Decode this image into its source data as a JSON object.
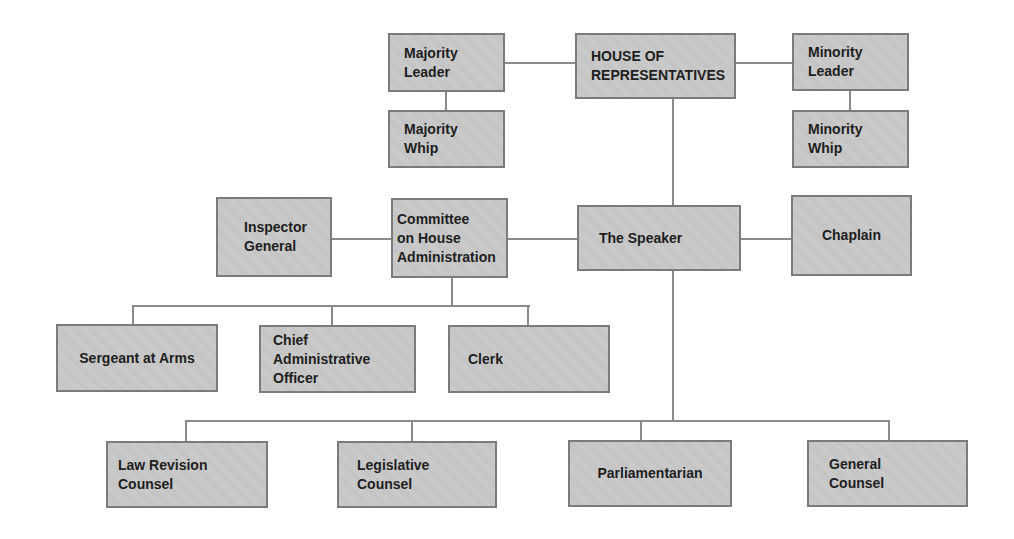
{
  "diagram": {
    "type": "org-chart",
    "colors": {
      "box_fill": "#c9c9c9",
      "box_border": "#7b7b7b",
      "connector": "#8a8a8a",
      "text": "#1e1e1e"
    },
    "nodes": {
      "house": "HOUSE OF\nREPRESENTATIVES",
      "majority_leader": "Majority\nLeader",
      "majority_whip": "Majority\nWhip",
      "minority_leader": "Minority\nLeader",
      "minority_whip": "Minority\nWhip",
      "inspector_general": "Inspector\nGeneral",
      "committee": "Committee\non House\nAdministration",
      "speaker": "The Speaker",
      "chaplain": "Chaplain",
      "sergeant": "Sergeant at Arms",
      "cao": "Chief\nAdministrative\nOfficer",
      "clerk": "Clerk",
      "law_revision": "Law Revision\nCounsel",
      "legislative": "Legislative\nCounsel",
      "parliamentarian": "Parliamentarian",
      "general_counsel": "General\nCounsel"
    },
    "edges": [
      [
        "house",
        "majority_leader"
      ],
      [
        "house",
        "minority_leader"
      ],
      [
        "majority_leader",
        "majority_whip"
      ],
      [
        "minority_leader",
        "minority_whip"
      ],
      [
        "house",
        "speaker"
      ],
      [
        "speaker",
        "committee"
      ],
      [
        "speaker",
        "chaplain"
      ],
      [
        "committee",
        "inspector_general"
      ],
      [
        "committee",
        "sergeant"
      ],
      [
        "committee",
        "cao"
      ],
      [
        "committee",
        "clerk"
      ],
      [
        "speaker",
        "law_revision"
      ],
      [
        "speaker",
        "legislative"
      ],
      [
        "speaker",
        "parliamentarian"
      ],
      [
        "speaker",
        "general_counsel"
      ]
    ]
  }
}
